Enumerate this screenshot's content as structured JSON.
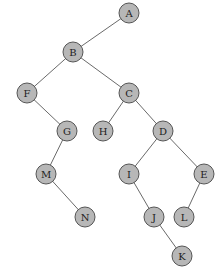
{
  "diagram": {
    "type": "binary-tree",
    "style": {
      "node_fill": "#b7b7b7",
      "node_stroke": "#555555",
      "edge_color": "#6a6a6a",
      "label_color": "#222222",
      "node_radius": 10
    },
    "nodes": [
      {
        "id": "A",
        "label": "A",
        "x": 129,
        "y": 13
      },
      {
        "id": "B",
        "label": "B",
        "x": 73,
        "y": 52
      },
      {
        "id": "F",
        "label": "F",
        "x": 27,
        "y": 93
      },
      {
        "id": "C",
        "label": "C",
        "x": 129,
        "y": 93
      },
      {
        "id": "G",
        "label": "G",
        "x": 67,
        "y": 131
      },
      {
        "id": "H",
        "label": "H",
        "x": 103,
        "y": 131
      },
      {
        "id": "D",
        "label": "D",
        "x": 163,
        "y": 131
      },
      {
        "id": "M",
        "label": "M",
        "x": 46,
        "y": 174
      },
      {
        "id": "I",
        "label": "I",
        "x": 129,
        "y": 174
      },
      {
        "id": "E",
        "label": "E",
        "x": 204,
        "y": 174
      },
      {
        "id": "N",
        "label": "N",
        "x": 85,
        "y": 217
      },
      {
        "id": "J",
        "label": "J",
        "x": 154,
        "y": 217
      },
      {
        "id": "L",
        "label": "L",
        "x": 184,
        "y": 217
      },
      {
        "id": "K",
        "label": "K",
        "x": 182,
        "y": 256
      }
    ],
    "edges": [
      {
        "from": "A",
        "to": "B"
      },
      {
        "from": "B",
        "to": "F"
      },
      {
        "from": "B",
        "to": "C"
      },
      {
        "from": "F",
        "to": "G"
      },
      {
        "from": "C",
        "to": "H"
      },
      {
        "from": "C",
        "to": "D"
      },
      {
        "from": "G",
        "to": "M"
      },
      {
        "from": "D",
        "to": "I"
      },
      {
        "from": "D",
        "to": "E"
      },
      {
        "from": "M",
        "to": "N"
      },
      {
        "from": "I",
        "to": "J"
      },
      {
        "from": "E",
        "to": "L"
      },
      {
        "from": "J",
        "to": "K"
      }
    ]
  }
}
